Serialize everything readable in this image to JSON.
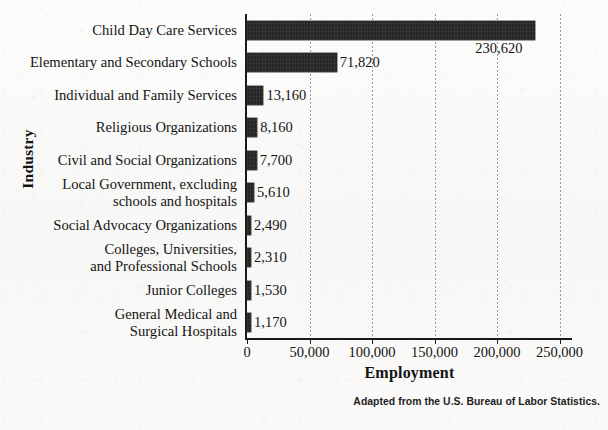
{
  "chart_data": {
    "type": "bar",
    "orientation": "horizontal",
    "title": "",
    "xlabel": "Employment",
    "ylabel": "Industry",
    "xlim": [
      0,
      260000
    ],
    "xticks": [
      0,
      50000,
      100000,
      150000,
      200000,
      250000
    ],
    "xtick_labels": [
      "0",
      "50,000",
      "100,000",
      "150,000",
      "200,000",
      "250,000"
    ],
    "grid": "vertical-dotted",
    "legend": null,
    "bar_color": "#262626",
    "categories": [
      "Child Day Care Services",
      "Elementary and Secondary Schools",
      "Individual and Family Services",
      "Religious Organizations",
      "Civil and Social Organizations",
      "Local Government, excluding schools and hospitals",
      "Social Advocacy Organizations",
      "Colleges, Universities, and Professional Schools",
      "Junior Colleges",
      "General Medical and Surgical Hospitals"
    ],
    "category_lines": [
      [
        "Child Day Care Services"
      ],
      [
        "Elementary and Secondary Schools"
      ],
      [
        "Individual and Family Services"
      ],
      [
        "Religious Organizations"
      ],
      [
        "Civil and Social Organizations"
      ],
      [
        "Local Government, excluding",
        "schools and hospitals"
      ],
      [
        "Social Advocacy Organizations"
      ],
      [
        "Colleges, Universities,",
        "and Professional Schools"
      ],
      [
        "Junior Colleges"
      ],
      [
        "General Medical and",
        "Surgical Hospitals"
      ]
    ],
    "values": [
      230620,
      71820,
      13160,
      8160,
      7700,
      5610,
      2490,
      2310,
      1530,
      1170
    ],
    "value_labels": [
      "230,620",
      "71,820",
      "13,160",
      "8,160",
      "7,700",
      "5,610",
      "2,490",
      "2,310",
      "1,530",
      "1,170"
    ]
  },
  "source_note": "Adapted from the U.S. Bureau of Labor Statistics."
}
